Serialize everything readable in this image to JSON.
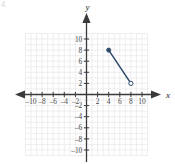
{
  "figure": {
    "corner_mark": "4.",
    "axis_x_label": "x",
    "axis_y_label": "y"
  },
  "chart_data": {
    "type": "line",
    "title": "",
    "xlabel": "x",
    "ylabel": "y",
    "xlim": [
      -11,
      11
    ],
    "ylim": [
      -11,
      11
    ],
    "grid": true,
    "grid_step": 1,
    "legend": "none",
    "x_tick_labels": [
      "-10",
      "-8",
      "-6",
      "-4",
      "-2",
      "2",
      "4",
      "6",
      "8",
      "10"
    ],
    "x_tick_values": [
      -10,
      -8,
      -6,
      -4,
      -2,
      2,
      4,
      6,
      8,
      10
    ],
    "y_tick_labels": [
      "10",
      "8",
      "6",
      "4",
      "2",
      "-2",
      "-4",
      "-6",
      "-8",
      "-10"
    ],
    "y_tick_values": [
      10,
      8,
      6,
      4,
      2,
      -2,
      -4,
      -6,
      -8,
      -10
    ],
    "series": [
      {
        "name": "segment",
        "color": "#2d4a6b",
        "x": [
          4,
          8
        ],
        "y": [
          8,
          2
        ],
        "start_point": {
          "x": 4,
          "y": 8,
          "marker": "filled"
        },
        "end_point": {
          "x": 8,
          "y": 2,
          "marker": "open"
        }
      }
    ],
    "colors": {
      "segment": "#2d4a6b",
      "axis": "#3a3a3a",
      "grid": "#e6e6ea",
      "tick_label": "#4a4a4a"
    }
  }
}
